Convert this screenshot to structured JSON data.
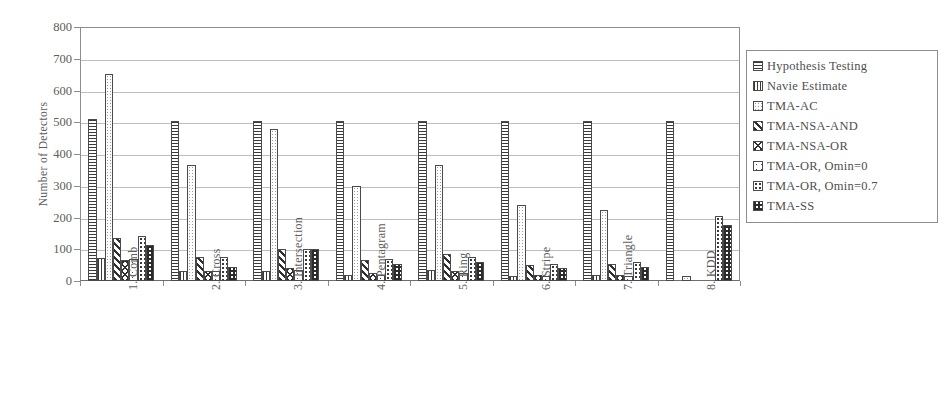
{
  "chart_data": {
    "type": "bar",
    "title": "",
    "xlabel": "",
    "ylabel": "Number of Detectors",
    "ylim": [
      0,
      800
    ],
    "ytick_step": 100,
    "yticks": [
      "800",
      "700",
      "600",
      "500",
      "400",
      "300",
      "200",
      "100",
      "0"
    ],
    "grid": true,
    "legend_position": "right",
    "categories": [
      "1. Comb",
      "2. Cross",
      "3. Intersection",
      "4. Pentagram",
      "5. Ring",
      "6. Stripe",
      "7. Triangle",
      "8. KDD"
    ],
    "series": [
      {
        "name": "Hypothesis Testing",
        "pattern": "horizontal-lines",
        "values": [
          510,
          505,
          505,
          505,
          505,
          505,
          505,
          505
        ]
      },
      {
        "name": "Navie Estimate",
        "pattern": "vertical-lines",
        "values": [
          72,
          30,
          30,
          20,
          35,
          15,
          18,
          0
        ]
      },
      {
        "name": "TMA-AC",
        "pattern": "light-dots",
        "values": [
          652,
          365,
          480,
          300,
          365,
          240,
          225,
          15
        ]
      },
      {
        "name": "TMA-NSA-AND",
        "pattern": "diagonal-dark",
        "values": [
          135,
          75,
          100,
          65,
          85,
          50,
          55,
          0
        ]
      },
      {
        "name": "TMA-NSA-OR",
        "pattern": "chevron",
        "values": [
          65,
          30,
          40,
          25,
          30,
          20,
          20,
          0
        ]
      },
      {
        "name": "TMA-OR, Omin=0",
        "pattern": "sparse-dots",
        "values": [
          70,
          30,
          35,
          20,
          25,
          15,
          15,
          0
        ]
      },
      {
        "name": "TMA-OR, Omin=0.7",
        "pattern": "grid-dots",
        "values": [
          143,
          75,
          100,
          70,
          75,
          55,
          60,
          205
        ]
      },
      {
        "name": "TMA-SS",
        "pattern": "checker",
        "values": [
          115,
          45,
          100,
          55,
          60,
          40,
          45,
          175
        ]
      }
    ]
  },
  "legend": {
    "items": [
      {
        "label": "Hypothesis Testing",
        "swatch": "horizontal-lines-swatch"
      },
      {
        "label": "Navie Estimate",
        "swatch": "vertical-lines-swatch"
      },
      {
        "label": "TMA-AC",
        "swatch": "light-dots-swatch"
      },
      {
        "label": "TMA-NSA-AND",
        "swatch": "diagonal-dark-swatch"
      },
      {
        "label": "TMA-NSA-OR",
        "swatch": "chevron-swatch"
      },
      {
        "label": "TMA-OR, Omin=0",
        "swatch": "sparse-dots-swatch"
      },
      {
        "label": "TMA-OR, Omin=0.7",
        "swatch": "grid-dots-swatch"
      },
      {
        "label": "TMA-SS",
        "swatch": "checker-swatch"
      }
    ]
  },
  "colors": {
    "axis": "#8d8d8d",
    "gridline": "#bdbdbd",
    "text": "#555555",
    "bar_outline": "#4a4a4a",
    "background": "#ffffff"
  }
}
